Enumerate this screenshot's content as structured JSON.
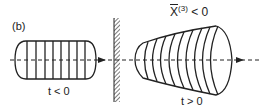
{
  "figure": {
    "panel_label": "(b)",
    "left_pulse": {
      "label": "t < 0",
      "slice_count": 8
    },
    "right_pulse": {
      "label": "t > 0",
      "slice_count": 9
    },
    "nonlinearity": {
      "symbol": "X",
      "superscript": "(3)",
      "relation": "< 0"
    },
    "colors": {
      "ink": "#222222",
      "background": "#ffffff"
    }
  }
}
